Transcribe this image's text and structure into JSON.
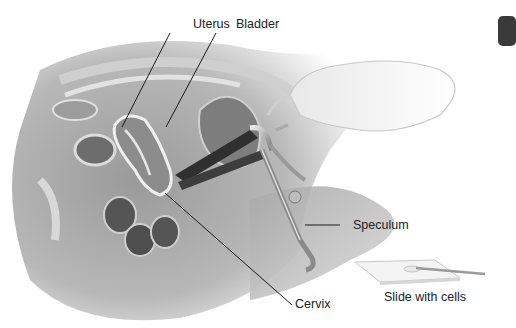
{
  "figure": {
    "labels": {
      "uterus": "Uterus",
      "bladder": "Bladder",
      "speculum": "Speculum",
      "cervix": "Cervix",
      "slide": "Slide with cells"
    }
  },
  "colors": {
    "background": "#ffffff",
    "leader_line": "#1a1a1a",
    "tab": "#3a3a3a"
  }
}
